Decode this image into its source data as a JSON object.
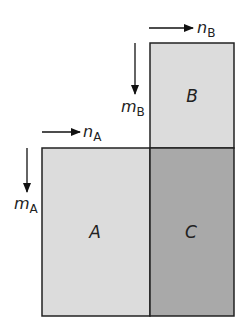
{
  "diagram": {
    "blocks": [
      {
        "id": "A",
        "label": "A",
        "x": 42,
        "y": 148,
        "w": 108,
        "h": 168,
        "fill": "#dcdcdc"
      },
      {
        "id": "B",
        "label": "B",
        "x": 150,
        "y": 43,
        "w": 84,
        "h": 105,
        "fill": "#dcdcdc"
      },
      {
        "id": "C",
        "label": "C",
        "x": 150,
        "y": 148,
        "w": 84,
        "h": 168,
        "fill": "#a9a9a9"
      }
    ],
    "dimensions": {
      "nA": {
        "main": "n",
        "sub": "A"
      },
      "mA": {
        "main": "m",
        "sub": "A"
      },
      "nB": {
        "main": "n",
        "sub": "B"
      },
      "mB": {
        "main": "m",
        "sub": "B"
      }
    },
    "colors": {
      "stroke": "#222222",
      "light": "#dcdcdc",
      "dark": "#a9a9a9"
    }
  }
}
